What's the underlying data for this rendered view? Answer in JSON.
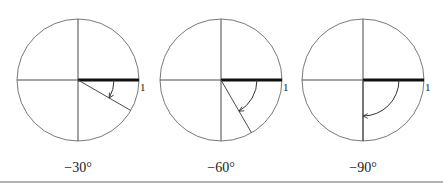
{
  "figure": {
    "unit_label": "1",
    "radius_px": 61,
    "arc_radius_px": 36,
    "center_y": 80,
    "panels": [
      {
        "angle_label": "−30°",
        "angle_deg": -30,
        "center_x": 78
      },
      {
        "angle_label": "−60°",
        "angle_deg": -60,
        "center_x": 221
      },
      {
        "angle_label": "−90°",
        "angle_deg": -90,
        "center_x": 363
      }
    ]
  }
}
